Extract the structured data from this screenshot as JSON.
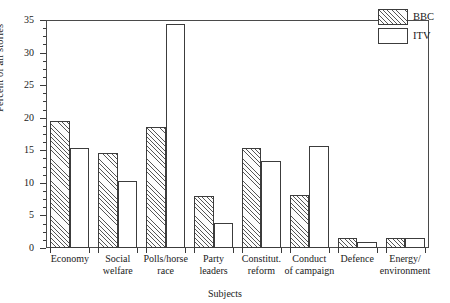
{
  "chart_data": {
    "type": "bar",
    "title": "",
    "subtitle": "",
    "xlabel": "Subjects",
    "ylabel": "Percent of all stories",
    "categories": [
      "Economy",
      "Social welfare",
      "Polls/horse race",
      "Party leaders",
      "Constitut. reform",
      "Conduct of campaign",
      "Defence",
      "Energy/ environment"
    ],
    "category_lines": [
      [
        "Economy"
      ],
      [
        "Social",
        "welfare"
      ],
      [
        "Polls/horse",
        "race"
      ],
      [
        "Party",
        "leaders"
      ],
      [
        "Constitut.",
        "reform"
      ],
      [
        "Conduct",
        "of campaign"
      ],
      [
        "Defence"
      ],
      [
        "Energy/",
        "environment"
      ]
    ],
    "series": [
      {
        "name": "BBC",
        "fill": "diagonal-hatch",
        "color": "#555555",
        "values": [
          19.5,
          14.6,
          18.6,
          8.0,
          15.4,
          8.1,
          1.5,
          1.6
        ]
      },
      {
        "name": "ITV",
        "fill": "white",
        "color": "#ffffff",
        "values": [
          15.4,
          10.3,
          34.4,
          3.9,
          13.3,
          15.6,
          0.9,
          1.5
        ]
      }
    ],
    "ylim": [
      0,
      35
    ],
    "yticks": [
      0,
      5,
      10,
      15,
      20,
      25,
      30,
      35
    ],
    "ytick_labels": [
      "0",
      "5",
      "10",
      "15",
      "20",
      "25",
      "30",
      "35"
    ],
    "yminor_step": 1.25,
    "grid": false,
    "legend_position": "top-right",
    "axis_color": "#3c3c3c"
  },
  "legend": {
    "entries": [
      {
        "label": "BBC"
      },
      {
        "label": "ITV"
      }
    ]
  }
}
